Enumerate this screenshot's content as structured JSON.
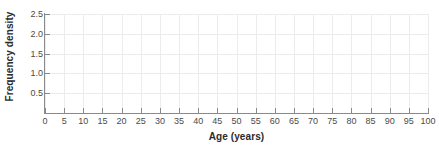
{
  "chart_data": {
    "type": "bar",
    "title": "",
    "subtitle": "",
    "xlabel": "Age (years)",
    "ylabel": "Frequency density",
    "xlim": [
      0,
      100
    ],
    "ylim": [
      0,
      2.5
    ],
    "xticks": [
      0,
      5,
      10,
      15,
      20,
      25,
      30,
      35,
      40,
      45,
      50,
      55,
      60,
      65,
      70,
      75,
      80,
      85,
      90,
      95,
      100
    ],
    "xticklabels": [
      "0",
      "5",
      "10",
      "15",
      "20",
      "25",
      "30",
      "35",
      "40",
      "45",
      "50",
      "55",
      "60",
      "65",
      "70",
      "75",
      "80",
      "85",
      "90",
      "95",
      "100"
    ],
    "yticks": [
      0.5,
      1.0,
      1.5,
      2.0,
      2.5
    ],
    "yticklabels": [
      "0.5",
      "1.0",
      "1.5",
      "2.0",
      "2.5"
    ],
    "grid": true,
    "legend": null,
    "categories": [],
    "values": [],
    "series": [],
    "annotations": [],
    "colors": {
      "background": "#ffffff",
      "gridline": "#ececec",
      "axis": "#8a8a8a",
      "tick_label": "#4a4a4a",
      "axis_title": "#2b2b2b"
    }
  }
}
